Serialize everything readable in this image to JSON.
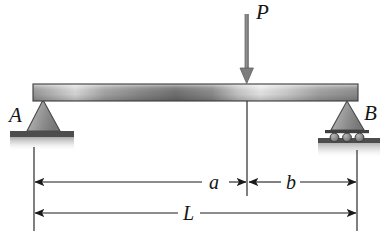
{
  "figure": {
    "name": "simply-supported-beam-with-point-load",
    "background_color": "#ffffff",
    "line_color": "#151515"
  },
  "labels": {
    "load": "P",
    "support_left": "A",
    "support_right": "B",
    "dim_a": "a",
    "dim_b": "b",
    "dim_L": "L"
  },
  "supports": {
    "left": {
      "type": "pin-support",
      "label": "A",
      "shape": "triangle",
      "apex_x": 43,
      "base_y": 131,
      "ground": "hatched-ground-bar"
    },
    "right": {
      "type": "roller-support",
      "label": "B",
      "shape": "triangle-on-rollers",
      "apex_x": 347,
      "base_y": 130,
      "roller_count": 3,
      "ground": "hatched-ground-bar"
    }
  },
  "beam": {
    "name": "beam-member",
    "x_start": 33,
    "x_end": 358,
    "y_top": 84,
    "y_bottom": 101,
    "fill_style": "horizontal-metallic-gradient",
    "colors": [
      "#8f8f8f",
      "#d8d8d8",
      "#6e6e6e",
      "#e8e8e8",
      "#9a9a9a"
    ]
  },
  "load": {
    "name": "point-load-P",
    "label": "P",
    "direction": "downward",
    "x": 247,
    "y_tail": 14,
    "y_head": 83,
    "color": "#7a7a7a"
  },
  "dimensions": [
    {
      "name": "dimension-a",
      "label": "a",
      "from": "support-A",
      "to": "load-point",
      "x_start": 34,
      "x_end": 247,
      "y": 182,
      "arrows": "both"
    },
    {
      "name": "dimension-b",
      "label": "b",
      "from": "load-point",
      "to": "support-B",
      "x_start": 247,
      "x_end": 357,
      "y": 182,
      "arrows": "both"
    },
    {
      "name": "dimension-L",
      "label": "L",
      "from": "support-A",
      "to": "support-B",
      "x_start": 34,
      "x_end": 357,
      "y": 213,
      "arrows": "both"
    }
  ],
  "extension_lines": [
    {
      "name": "extension-line-left",
      "x": 34,
      "y_top": 147,
      "y_bottom": 231
    },
    {
      "name": "extension-line-center",
      "x": 247,
      "y_top": 101,
      "y_bottom": 196
    },
    {
      "name": "extension-line-right",
      "x": 357,
      "y_top": 150,
      "y_bottom": 231
    }
  ]
}
